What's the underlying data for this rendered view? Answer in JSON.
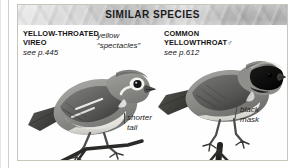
{
  "panel": {
    "header_title": "SIMILAR SPECIES"
  },
  "species": [
    {
      "id": "yellow-throated-vireo",
      "name_line1": "YELLOW-THROATED",
      "name_line2": "VIREO",
      "page_ref": "see p.445",
      "sex_symbol": ""
    },
    {
      "id": "common-yellowthroat",
      "name_line1": "COMMON",
      "name_line2": "YELLOWTHROAT",
      "page_ref": "see p.612",
      "sex_symbol": "♂"
    }
  ],
  "annotations": [
    {
      "id": "spectacles",
      "text": "yellow\n“spectacles”"
    },
    {
      "id": "shorter-tail",
      "text": "shorter\ntail"
    },
    {
      "id": "black-mask",
      "text": "black\nmask"
    }
  ],
  "colors": {
    "header_band": "#b4b4b4",
    "header_text": "#1b1b1b",
    "card_border": "#c9c5bd",
    "plate_background": "#fefefe",
    "annotation_text": "#1d1d1d",
    "leader_line": "#4a4a4a"
  }
}
